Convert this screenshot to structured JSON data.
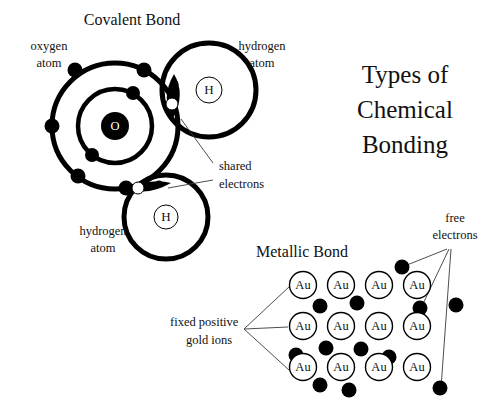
{
  "page": {
    "background": "#ffffff",
    "ink": "#111111",
    "width": 493,
    "height": 409
  },
  "title": {
    "lines": [
      "Types of",
      "Chemical",
      "Bonding"
    ],
    "line1": "Types of",
    "line2": "Chemical",
    "line3": "Bonding"
  },
  "covalent": {
    "heading": "Covalent Bond",
    "labels": {
      "oxygen_line1": "oxygen",
      "oxygen_line2": "atom",
      "hydrogen_top_line1": "hydrogen",
      "hydrogen_top_line2": "atom",
      "hydrogen_bottom_line1": "hydrogen",
      "hydrogen_bottom_line2": "atom",
      "shared_line1": "shared",
      "shared_line2": "electrons"
    },
    "symbols": {
      "oxygen_nucleus": "O",
      "hydrogen_top": "H",
      "hydrogen_bottom": "H"
    },
    "oxygen": {
      "center_x": 115,
      "center_y": 126,
      "outer_shell_radius": 63,
      "inner_shell_radius": 37,
      "nucleus_radius": 14,
      "outer_electron_angles_deg": [
        -118,
        -63,
        180,
        88,
        128
      ],
      "inner_electron_angles_deg": [
        -62,
        118
      ]
    },
    "hydrogen_top": {
      "center_x": 209,
      "center_y": 90,
      "shell_radius": 47,
      "nucleus_radius": 13
    },
    "hydrogen_bottom": {
      "center_x": 166,
      "center_y": 217,
      "shell_radius": 42,
      "nucleus_radius": 12
    },
    "shared_pairs": 2,
    "shared_pair_notes": "lens-shaped overlap regions each holding one white and one black electron"
  },
  "metallic": {
    "heading": "Metallic Bond",
    "labels": {
      "free_line1": "free",
      "free_line2": "electrons",
      "fixed_line1": "fixed positive",
      "fixed_line2": "gold ions"
    },
    "ion_symbol": "Au",
    "lattice": {
      "rows": 3,
      "cols": 4,
      "ion_radius": 13.5,
      "x_start": 303,
      "y_start": 285,
      "x_step": 38,
      "y_step": 41
    },
    "free_electron_radius": 7.5,
    "free_electrons": [
      {
        "x": 320,
        "y": 306
      },
      {
        "x": 357,
        "y": 303
      },
      {
        "x": 402,
        "y": 267
      },
      {
        "x": 420,
        "y": 308
      },
      {
        "x": 456,
        "y": 305
      },
      {
        "x": 326,
        "y": 348
      },
      {
        "x": 361,
        "y": 349
      },
      {
        "x": 389,
        "y": 357
      },
      {
        "x": 296,
        "y": 355
      },
      {
        "x": 320,
        "y": 385
      },
      {
        "x": 349,
        "y": 390
      },
      {
        "x": 440,
        "y": 388
      }
    ],
    "free_electron_callout_targets": [
      {
        "x": 402,
        "y": 267
      },
      {
        "x": 420,
        "y": 308
      },
      {
        "x": 440,
        "y": 388
      }
    ],
    "ion_callout_targets": [
      {
        "x": 303,
        "y": 285
      },
      {
        "x": 303,
        "y": 326
      },
      {
        "x": 303,
        "y": 367
      }
    ]
  }
}
